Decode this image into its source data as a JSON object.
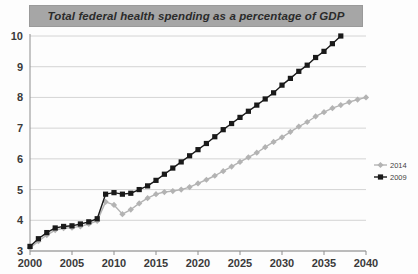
{
  "title": "Total  federal health spending as a percentage of GDP",
  "colors": {
    "series_2009": "#1a1a1a",
    "series_2014": "#b3b3b3",
    "title_bar": "#a6a6a6",
    "gridline": "#c9c9c9",
    "axis": "#8d8d8d"
  },
  "legend": {
    "position": "right",
    "items": [
      {
        "label": "2014",
        "color": "#b3b3b3",
        "marker": "diamond"
      },
      {
        "label": "2009",
        "color": "#1a1a1a",
        "marker": "square"
      }
    ]
  },
  "chart_data": {
    "type": "line",
    "title": "Total  federal health spending as a percentage of GDP",
    "xlabel": "",
    "ylabel": "",
    "xlim": [
      2000,
      2040
    ],
    "ylim": [
      3,
      10
    ],
    "xticks": [
      2000,
      2005,
      2010,
      2015,
      2020,
      2025,
      2030,
      2035,
      2040
    ],
    "yticks": [
      3,
      4,
      5,
      6,
      7,
      8,
      9,
      10
    ],
    "grid": true,
    "series": [
      {
        "name": "2009",
        "color": "#1a1a1a",
        "marker": "square",
        "x": [
          2000,
          2001,
          2002,
          2003,
          2004,
          2005,
          2006,
          2007,
          2008,
          2009,
          2010,
          2011,
          2012,
          2013,
          2014,
          2015,
          2016,
          2017,
          2018,
          2019,
          2020,
          2021,
          2022,
          2023,
          2024,
          2025,
          2026,
          2027,
          2028,
          2029,
          2030,
          2031,
          2032,
          2033,
          2034,
          2035,
          2036,
          2037
        ],
        "values": [
          3.15,
          3.4,
          3.6,
          3.75,
          3.8,
          3.82,
          3.88,
          3.95,
          4.05,
          4.85,
          4.9,
          4.85,
          4.88,
          5.0,
          5.12,
          5.3,
          5.5,
          5.7,
          5.9,
          6.1,
          6.3,
          6.5,
          6.72,
          6.95,
          7.15,
          7.35,
          7.55,
          7.75,
          7.95,
          8.15,
          8.4,
          8.62,
          8.85,
          9.05,
          9.3,
          9.5,
          9.75,
          10.0
        ]
      },
      {
        "name": "2014",
        "color": "#b3b3b3",
        "marker": "diamond",
        "x": [
          2000,
          2001,
          2002,
          2003,
          2004,
          2005,
          2006,
          2007,
          2008,
          2009,
          2010,
          2011,
          2012,
          2013,
          2014,
          2015,
          2016,
          2017,
          2018,
          2019,
          2020,
          2021,
          2022,
          2023,
          2024,
          2025,
          2026,
          2027,
          2028,
          2029,
          2030,
          2031,
          2032,
          2033,
          2034,
          2035,
          2036,
          2037,
          2038,
          2039,
          2040
        ],
        "values": [
          3.1,
          3.32,
          3.52,
          3.68,
          3.74,
          3.76,
          3.8,
          3.88,
          3.98,
          4.6,
          4.5,
          4.2,
          4.35,
          4.55,
          4.72,
          4.85,
          4.92,
          4.95,
          5.0,
          5.08,
          5.2,
          5.32,
          5.45,
          5.6,
          5.75,
          5.9,
          6.05,
          6.2,
          6.38,
          6.55,
          6.7,
          6.88,
          7.05,
          7.2,
          7.38,
          7.52,
          7.65,
          7.75,
          7.85,
          7.93,
          8.0
        ]
      }
    ]
  }
}
